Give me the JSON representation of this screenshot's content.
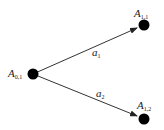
{
  "nodes": [
    {
      "id": "A01",
      "base": "A",
      "sub": "0,1",
      "cx": 33,
      "cy": 74
    },
    {
      "id": "A11",
      "base": "A",
      "sub": "1,1",
      "cx": 144,
      "cy": 25
    },
    {
      "id": "A12",
      "base": "A",
      "sub": "1,2",
      "cx": 144,
      "cy": 119
    }
  ],
  "edges": [
    {
      "from": "A01",
      "to": "A11",
      "label_base": "a",
      "label_sub": "1"
    },
    {
      "from": "A01",
      "to": "A12",
      "label_base": "a",
      "label_sub": "2"
    }
  ],
  "colors": {
    "node": "#000000",
    "edge": "#333333",
    "text": "#222222"
  }
}
